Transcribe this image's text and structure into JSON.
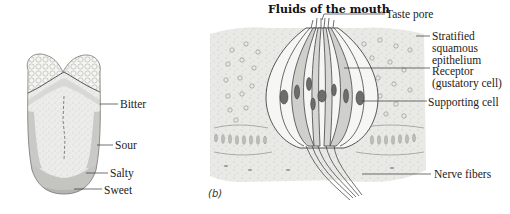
{
  "figure": {
    "panel_a": {
      "subject": "tongue taste regions",
      "labels": [
        {
          "id": "bitter",
          "text": "Bitter"
        },
        {
          "id": "sour",
          "text": "Sour"
        },
        {
          "id": "salty",
          "text": "Salty"
        },
        {
          "id": "sweet",
          "text": "Sweet"
        }
      ]
    },
    "panel_b": {
      "panel_label": "(b)",
      "title": "Fluids of the mouth",
      "labels": [
        {
          "id": "taste-pore",
          "text": "Taste pore"
        },
        {
          "id": "stratified-1",
          "text": "Stratified"
        },
        {
          "id": "stratified-2",
          "text": "squamous"
        },
        {
          "id": "stratified-3",
          "text": "epithelium"
        },
        {
          "id": "receptor-1",
          "text": "Receptor"
        },
        {
          "id": "receptor-2",
          "text": "(gustatory cell)"
        },
        {
          "id": "supporting",
          "text": "Supporting cell"
        },
        {
          "id": "nerve",
          "text": "Nerve fibers"
        }
      ]
    }
  }
}
